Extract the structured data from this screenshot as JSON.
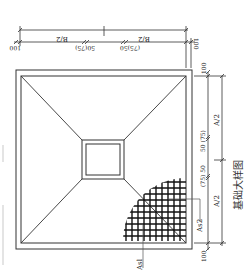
{
  "figure": {
    "caption": "基础大样图",
    "orientation_note": "rotated"
  },
  "top_dimensions": {
    "outer_left": "100",
    "outer_right": "100",
    "half_left": "B/2",
    "half_right": "B/2",
    "inner_left": "50(75)",
    "inner_right": "(75)50"
  },
  "right_dimensions": {
    "top_edge": "100",
    "bottom_edge": "100",
    "half_top": "A/2",
    "half_bottom": "A/2",
    "inner_top": "50 (75)",
    "inner_bottom": "(75) 50"
  },
  "rebar_labels": {
    "bottom": "Asl",
    "right": "As2"
  },
  "colors": {
    "line": "#222222",
    "faint": "#999999",
    "background": "#ffffff"
  }
}
